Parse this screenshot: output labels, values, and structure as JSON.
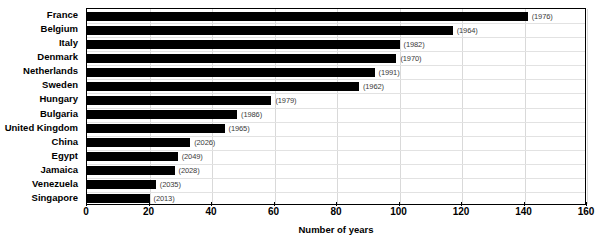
{
  "chart_data": {
    "type": "bar",
    "orientation": "horizontal",
    "title": "",
    "xlabel": "Number of years",
    "ylabel": "",
    "xlim": [
      0,
      160
    ],
    "xticks": [
      0,
      20,
      40,
      60,
      80,
      100,
      120,
      140,
      160
    ],
    "grid": true,
    "legend": null,
    "categories": [
      "France",
      "Belgium",
      "Italy",
      "Denmark",
      "Netherlands",
      "Sweden",
      "Hungary",
      "Bulgaria",
      "United Kingdom",
      "China",
      "Egypt",
      "Jamaica",
      "Venezuela",
      "Singapore"
    ],
    "values": [
      141,
      117,
      100,
      99,
      92,
      87,
      59,
      48,
      44,
      33,
      29,
      28,
      22,
      20
    ],
    "point_labels": [
      "(1976)",
      "(1964)",
      "(1982)",
      "(1970)",
      "(1991)",
      "(1962)",
      "(1979)",
      "(1986)",
      "(1965)",
      "(2026)",
      "(2049)",
      "(2028)",
      "(2035)",
      "(2013)"
    ],
    "bar_color": "#000000",
    "background_color": "#ffffff"
  }
}
